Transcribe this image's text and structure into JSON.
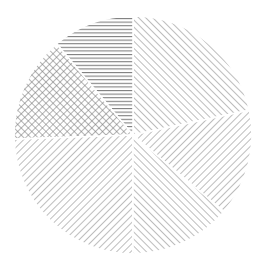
{
  "figure": {
    "width": 266,
    "height": 274,
    "background_color": "#ffffff",
    "title": "",
    "has_legend": false,
    "has_axes": false,
    "has_labels": false
  },
  "chart_data": {
    "type": "pie",
    "title": "",
    "subtitle": "",
    "xlabel": "",
    "ylabel": "",
    "legend_position": "none",
    "grid": false,
    "labels_shown": false,
    "center_x": 133,
    "center_y": 135,
    "radius": 119,
    "start_angle_deg": 12,
    "direction": "counterclockwise",
    "categories": [
      "Slice A",
      "Slice B",
      "Slice C",
      "Slice D",
      "Slice E",
      "Slice F"
    ],
    "values": [
      21.7,
      11.1,
      14.4,
      24.4,
      13.9,
      14.5
    ],
    "angles_deg": [
      78,
      40,
      52,
      88,
      50,
      52
    ],
    "percentages": [
      "21.7%",
      "11.1%",
      "14.4%",
      "24.4%",
      "13.9%",
      "14.5%"
    ],
    "hatches": [
      "/",
      "-",
      "x",
      "\\",
      "/",
      "\\"
    ],
    "wedge_face_color": "#ffffff",
    "wedge_edge_color": "#ffffff",
    "hatch_color": "#808080",
    "series": [
      {
        "name": "Slice A",
        "value": 21.7,
        "hatch": "/",
        "hatch_name": "forward-diagonal",
        "start_deg": 12,
        "end_deg": 90
      },
      {
        "name": "Slice B",
        "value": 11.1,
        "hatch": "-",
        "hatch_name": "horizontal",
        "start_deg": 90,
        "end_deg": 130
      },
      {
        "name": "Slice C",
        "value": 14.4,
        "hatch": "x",
        "hatch_name": "crosshatch",
        "start_deg": 130,
        "end_deg": 182
      },
      {
        "name": "Slice D",
        "value": 24.4,
        "hatch": "\\",
        "hatch_name": "back-diagonal",
        "start_deg": 182,
        "end_deg": 270
      },
      {
        "name": "Slice E",
        "value": 13.9,
        "hatch": "/",
        "hatch_name": "forward-diagonal",
        "start_deg": 270,
        "end_deg": 320
      },
      {
        "name": "Slice F",
        "value": 14.5,
        "hatch": "\\",
        "hatch_name": "back-diagonal",
        "start_deg": 320,
        "end_deg": 372
      }
    ]
  }
}
